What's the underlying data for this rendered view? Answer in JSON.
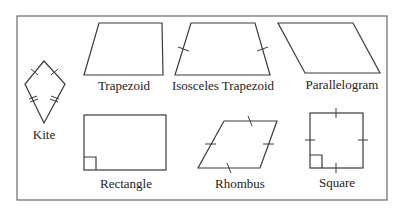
{
  "diagram": {
    "shapes": [
      {
        "id": "kite",
        "label": "Kite"
      },
      {
        "id": "trapezoid",
        "label": "Trapezoid"
      },
      {
        "id": "isosceles-trapezoid",
        "label": "Isosceles Trapezoid"
      },
      {
        "id": "parallelogram",
        "label": "Parallelogram"
      },
      {
        "id": "rectangle",
        "label": "Rectangle"
      },
      {
        "id": "rhombus",
        "label": "Rhombus"
      },
      {
        "id": "square",
        "label": "Square"
      }
    ]
  }
}
